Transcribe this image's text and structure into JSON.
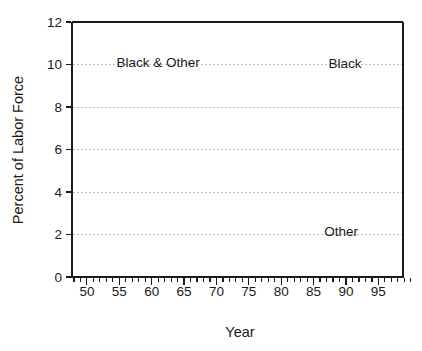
{
  "chart_data": {
    "type": "line",
    "title": "",
    "xlabel": "Year",
    "ylabel": "Percent of Labor Force",
    "xlim": [
      47.7,
      98.8
    ],
    "ylim": [
      0,
      12
    ],
    "x_major_ticks": [
      50,
      55,
      60,
      65,
      70,
      75,
      80,
      85,
      90,
      95
    ],
    "x_minor_tick_range": [
      48,
      100
    ],
    "y_ticks": [
      0,
      2,
      4,
      6,
      8,
      10,
      12
    ],
    "gridlines_y": [
      2,
      4,
      6,
      8,
      10
    ],
    "grid": "dotted-horizontal",
    "legend_position": "inline-annotations",
    "line_color": "#1a1a1a",
    "grid_color": "#bcbcbc",
    "annotations": [
      {
        "text": "Black & Other",
        "x": 61.0,
        "y": 9.88
      },
      {
        "text": "Black",
        "x": 89.85,
        "y": 9.83
      },
      {
        "text": "Other",
        "x": 89.25,
        "y": 1.93
      }
    ],
    "series": [
      {
        "name": "Black & Other",
        "x_start": 1953.5,
        "x_step": 0.25,
        "values": [
          10.78,
          10.62,
          10.72,
          10.58,
          10.7,
          10.82,
          10.64,
          10.74,
          10.66,
          10.78,
          10.7,
          10.62,
          10.76,
          10.68,
          10.8,
          10.72,
          10.84,
          10.76,
          10.88,
          10.8,
          10.92,
          11.0,
          10.9,
          11.02,
          10.94,
          11.06,
          11.1,
          10.98,
          11.08,
          11.14,
          11.04,
          11.12,
          11.18,
          11.08,
          11.16,
          11.1,
          11.2,
          11.12,
          11.22,
          11.14,
          11.24,
          11.16,
          11.2,
          11.1,
          11.18,
          11.12,
          11.22,
          11.16,
          11.24,
          11.18,
          11.12,
          11.2,
          11.14,
          11.22,
          11.16,
          11.1,
          11.18,
          11.12,
          11.2,
          11.14,
          11.08,
          11.16,
          11.1,
          11.18,
          11.12,
          11.06,
          11.14,
          11.08,
          11.16,
          11.1,
          11.04,
          11.12,
          11.16,
          11.08,
          11.14
        ]
      },
      {
        "name": "Black",
        "x_start": 1972.0,
        "x_step": 0.25,
        "values": [
          10.16,
          10.1,
          10.14,
          10.06,
          10.08,
          10.02,
          10.06,
          10.0,
          10.02,
          9.97,
          10.01,
          9.95,
          9.98,
          9.94,
          9.99,
          9.95,
          10.01,
          9.97,
          10.04,
          10.0,
          10.07,
          10.04,
          10.11,
          10.08,
          10.15,
          10.12,
          10.19,
          10.16,
          10.22,
          10.19,
          10.26,
          10.23,
          10.3,
          10.27,
          10.34,
          10.31,
          10.38,
          10.35,
          10.42,
          10.39,
          10.46,
          10.43,
          10.5,
          10.47,
          10.53,
          10.5,
          10.57,
          10.55,
          10.62,
          10.59,
          10.67,
          10.64,
          10.7,
          10.67,
          10.74,
          10.71,
          10.78,
          10.75,
          10.82,
          10.8,
          10.87,
          10.84,
          10.91,
          10.89,
          10.95,
          10.93,
          10.99,
          10.96,
          11.0,
          10.97,
          11.03,
          11.01,
          11.04,
          11.01,
          11.06,
          11.01,
          10.99,
          10.96,
          11.01,
          10.99,
          11.03,
          11.01,
          11.06,
          11.03,
          11.08,
          11.06,
          11.11,
          11.08,
          11.13,
          11.11,
          11.16,
          11.14,
          11.21,
          11.19,
          11.26,
          11.24,
          11.31,
          11.29,
          11.35,
          11.33,
          11.37,
          11.35,
          11.41,
          11.39,
          11.45,
          11.53
        ]
      },
      {
        "name": "Other",
        "x_start": 1972.0,
        "x_step": 0.25,
        "values": [
          1.2,
          1.23,
          1.27,
          1.31,
          1.36,
          1.39,
          1.43,
          1.46,
          1.52,
          1.54,
          1.58,
          1.62,
          1.66,
          1.68,
          1.72,
          1.74,
          1.78,
          1.81,
          1.84,
          1.88,
          1.92,
          1.94,
          1.98,
          2.02,
          2.06,
          2.08,
          2.12,
          2.16,
          2.2,
          2.22,
          2.26,
          2.3,
          2.34,
          2.36,
          2.4,
          2.42,
          2.46,
          2.48,
          2.52,
          2.54,
          2.56,
          2.6,
          2.62,
          2.66,
          2.68,
          2.72,
          2.74,
          2.7,
          2.64,
          2.72,
          2.8,
          2.86,
          2.9,
          2.94,
          2.98,
          3.02,
          3.06,
          3.09,
          3.12,
          3.15,
          3.18,
          3.21,
          3.24,
          3.28,
          3.31,
          3.35,
          3.38,
          3.42,
          3.45,
          3.49,
          3.53,
          3.57,
          3.78,
          3.82,
          3.86,
          3.9,
          3.94,
          3.97,
          4.0,
          4.03,
          4.07,
          4.1,
          4.13,
          4.15,
          4.17,
          4.15,
          4.19,
          4.17,
          4.21,
          4.19,
          4.17,
          4.21,
          4.19,
          4.23,
          4.25,
          4.27,
          4.29,
          4.31,
          4.29,
          4.33,
          4.35,
          4.37,
          4.41,
          4.43,
          4.47,
          4.52
        ]
      }
    ]
  }
}
